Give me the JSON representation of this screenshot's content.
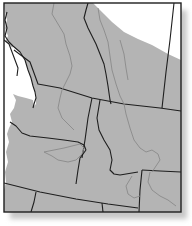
{
  "map": {
    "description": "Regional map of the Pacific Northwest showing a shaded range area with province/state boundaries and rivers",
    "colors": {
      "background": "#ffffff",
      "land_shaded": "#b4b4b4",
      "unshaded": "#ffffff",
      "boundary": "#1e1e1e",
      "river": "#8a8a8a",
      "shadow": "#c8c8c8"
    },
    "regions": [
      "British Columbia",
      "Alberta",
      "Washington",
      "Idaho",
      "Montana",
      "Oregon",
      "Wyoming",
      "Nevada",
      "Utah"
    ],
    "labels": []
  }
}
